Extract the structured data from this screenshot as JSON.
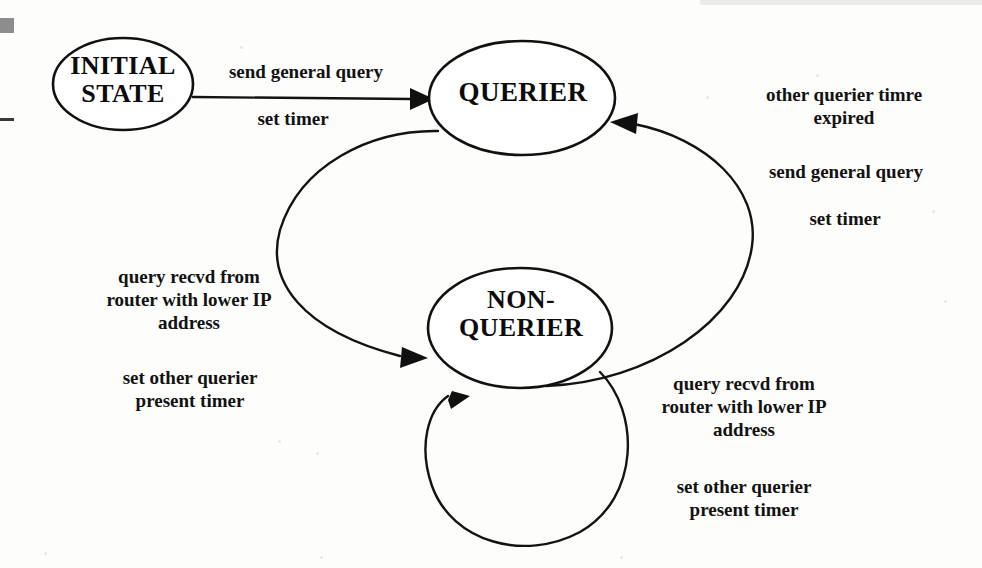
{
  "page": {
    "background_color": "#fdfdfc",
    "ink_color": "#111111"
  },
  "nodes": [
    {
      "id": "initial-state",
      "label": "INITIAL\nSTATE",
      "cx": 123,
      "cy": 84,
      "rx": 70,
      "ry": 46
    },
    {
      "id": "querier",
      "label": "QUERIER",
      "cx": 522,
      "cy": 98,
      "rx": 93,
      "ry": 57
    },
    {
      "id": "non-querier",
      "label": "NON-\nQUERIER",
      "cx": 520,
      "cy": 328,
      "rx": 92,
      "ry": 60
    }
  ],
  "edges": [
    {
      "id": "initial-to-querier",
      "from": "initial-state",
      "to": "querier",
      "shape": "straight",
      "event": "send general query",
      "action": "set timer"
    },
    {
      "id": "querier-to-non-querier",
      "from": "querier",
      "to": "non-querier",
      "shape": "curve-left",
      "event": "query recvd from\nrouter with lower IP\naddress",
      "action": "set other querier\npresent timer"
    },
    {
      "id": "non-querier-to-querier",
      "from": "non-querier",
      "to": "querier",
      "shape": "curve-right",
      "event": "other querier timre\nexpired",
      "action_primary": "send general query",
      "action_secondary": "set timer"
    },
    {
      "id": "non-querier-self-loop",
      "from": "non-querier",
      "to": "non-querier",
      "shape": "self-loop",
      "event": "query recvd from\nrouter with lower IP\naddress",
      "action": "set other querier\npresent timer"
    }
  ],
  "labels": {
    "send_general_query_top": "send general query",
    "set_timer_top": "set timer",
    "other_querier_timre_expired": "other querier timre\nexpired",
    "send_general_query_right": "send general query",
    "set_timer_right": "set timer",
    "query_recvd_left": "query recvd from\nrouter with lower IP\naddress",
    "set_other_querier_left": "set other querier\npresent timer",
    "query_recvd_right": "query recvd from\nrouter with lower IP\naddress",
    "set_other_querier_right": "set other querier\npresent timer"
  },
  "node_labels": {
    "initial_state": "INITIAL\nSTATE",
    "querier": "QUERIER",
    "non_querier": "NON-\nQUERIER"
  }
}
